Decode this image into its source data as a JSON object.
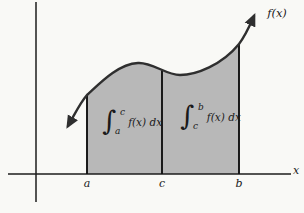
{
  "diagram": {
    "curve_label": "f(x)",
    "axis_label_x": "x",
    "ticks": {
      "a": "a",
      "c": "c",
      "b": "b"
    },
    "integral_left": {
      "symbol": "∫",
      "upper_limit": "c",
      "lower_limit": "a",
      "integrand": "f(x) dx"
    },
    "integral_right": {
      "symbol": "∫",
      "upper_limit": "b",
      "lower_limit": "c",
      "integrand": "f(x) dx"
    },
    "colors": {
      "shade": "#b8b8b8",
      "curve": "#2f2f2f",
      "axis": "#1c1c1c",
      "background": "#f9f9f6"
    }
  }
}
